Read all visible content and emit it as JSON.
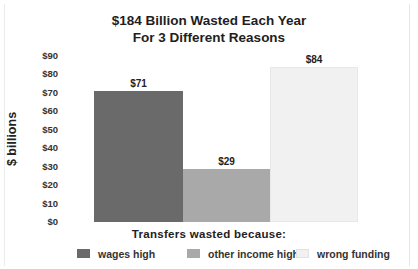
{
  "chart_data": {
    "type": "bar",
    "title": "$184 Billion Wasted Each Year",
    "subtitle": "For 3 Different Reasons",
    "xlabel": "Transfers wasted because:",
    "ylabel": "$ billions",
    "ylim": [
      0,
      90
    ],
    "yticks": [
      "$0",
      "$10",
      "$20",
      "$30",
      "$40",
      "$50",
      "$60",
      "$70",
      "$80",
      "$90"
    ],
    "grid": false,
    "legend_position": "bottom",
    "categories": [
      "wages high",
      "other income high",
      "wrong funding"
    ],
    "values": [
      71,
      29,
      84
    ],
    "value_labels": [
      "$71",
      "$29",
      "$84"
    ],
    "colors": [
      "#6a6a6a",
      "#a9a9a9",
      "#f1f1f1"
    ]
  },
  "legend": [
    {
      "label": "wages high",
      "color": "#6a6a6a"
    },
    {
      "label": "other income high",
      "color": "#a9a9a9"
    },
    {
      "label": "wrong funding",
      "color": "#f1f1f1"
    }
  ]
}
